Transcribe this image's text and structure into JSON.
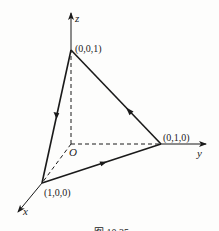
{
  "figure": {
    "axes": {
      "x_label": "x",
      "y_label": "y",
      "z_label": "z",
      "origin_label": "O"
    },
    "vertices": [
      {
        "label": "(0,0,1)",
        "coords": [
          0,
          0,
          1
        ]
      },
      {
        "label": "(0,1,0)",
        "coords": [
          0,
          1,
          0
        ]
      },
      {
        "label": "(1,0,0)",
        "coords": [
          1,
          0,
          0
        ]
      }
    ],
    "edges": [
      {
        "from": "(0,0,1)",
        "to": "(1,0,0)",
        "style": "solid",
        "arrow": "midpoint"
      },
      {
        "from": "(1,0,0)",
        "to": "(0,1,0)",
        "style": "solid",
        "arrow": "midpoint"
      },
      {
        "from": "(0,1,0)",
        "to": "(0,0,1)",
        "style": "solid",
        "arrow": "midpoint"
      },
      {
        "from": "O",
        "to": "(0,0,1)",
        "style": "dashed"
      },
      {
        "from": "O",
        "to": "(0,1,0)",
        "style": "dashed"
      },
      {
        "from": "O",
        "to": "(1,0,0)",
        "style": "dashed"
      }
    ],
    "caption": "图 10.35",
    "colors": {
      "line": "#1a1a1a",
      "background": "#fdfdfc"
    }
  }
}
